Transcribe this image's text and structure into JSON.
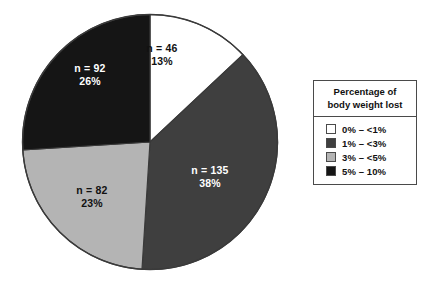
{
  "chart_data": {
    "type": "pie",
    "title": "",
    "legend_title_lines": [
      "Percentage of",
      "body weight lost"
    ],
    "legend_position": "right",
    "categories": [
      "0% – <1%",
      "1% – <3%",
      "3% – <5%",
      "5% – 10%"
    ],
    "values": [
      13,
      38,
      23,
      26
    ],
    "counts": [
      46,
      135,
      82,
      92
    ],
    "total_n": 355,
    "slices": [
      {
        "category": "0% – <1%",
        "count_label": "n = 46",
        "percent_label": "13%",
        "value": 13,
        "count": 46,
        "color": "#ffffff",
        "label_text_color": "dark"
      },
      {
        "category": "1% – <3%",
        "count_label": "n = 135",
        "percent_label": "38%",
        "value": 38,
        "count": 135,
        "color": "#3f3f3f",
        "label_text_color": "light"
      },
      {
        "category": "3% – <5%",
        "count_label": "n = 82",
        "percent_label": "23%",
        "value": 23,
        "count": 82,
        "color": "#b4b4b4",
        "label_text_color": "dark"
      },
      {
        "category": "5% – 10%",
        "count_label": "n = 92",
        "percent_label": "26%",
        "value": 26,
        "count": 92,
        "color": "#151515",
        "label_text_color": "light"
      }
    ],
    "colors": [
      "#ffffff",
      "#3f3f3f",
      "#b4b4b4",
      "#151515"
    ],
    "outline_color": "#3a3a3a",
    "start_angle_deg": 0,
    "direction": "clockwise"
  },
  "legend": {
    "title_line1": "Percentage of",
    "title_line2": "body weight lost",
    "items": [
      {
        "label": "0% – <1%",
        "color": "#ffffff"
      },
      {
        "label": "1% – <3%",
        "color": "#3f3f3f"
      },
      {
        "label": "3% – <5%",
        "color": "#b4b4b4"
      },
      {
        "label": "5% – 10%",
        "color": "#151515"
      }
    ]
  }
}
